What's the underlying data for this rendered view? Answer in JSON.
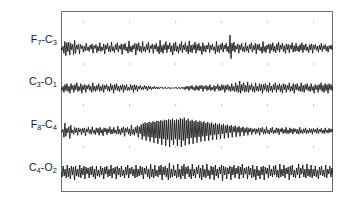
{
  "figure": {
    "background_color": "#ffffff",
    "frame_color": "#6d6d6d",
    "trace_color": "#111111",
    "tick_color": "#c9c9c9",
    "frame": {
      "x": 61,
      "y": 11,
      "width": 272,
      "height": 181
    }
  },
  "labels": {
    "ch1": "F7-C3",
    "ch1_main": "F",
    "ch1_sub1": "7",
    "ch1_mid": "-C",
    "ch1_sub2": "3",
    "ch2": "C3-O1",
    "ch2_main": "C",
    "ch2_sub1": "3",
    "ch2_mid": "-O",
    "ch2_sub2": "1",
    "ch3": "F8-C4",
    "ch3_main": "F",
    "ch3_sub1": "8",
    "ch3_mid": "-C",
    "ch3_sub2": "4",
    "ch4": "C4-O2",
    "ch4_main": "C",
    "ch4_sub1": "4",
    "ch4_mid": "-O",
    "ch4_sub2": "2"
  },
  "chart_data": {
    "type": "line",
    "title": "",
    "xlabel": "",
    "ylabel": "",
    "grid": false,
    "legend_position": "left-labels",
    "axis_ranges": {
      "x": [
        0,
        272
      ],
      "y": [
        0,
        181
      ]
    },
    "tick_marks_x": [
      22,
      68,
      114,
      160,
      206,
      252
    ],
    "tick_rows_y": [
      10,
      52,
      93,
      135
    ],
    "series": [
      {
        "name": "F7-C3",
        "baseline_y": 37,
        "amplitude": 13,
        "description": "moderate-to-high amplitude mixed-frequency activity with a large single transient near x=176",
        "values": [
          0,
          -4,
          3,
          -9,
          11,
          -13,
          9,
          -6,
          10,
          -12,
          8,
          -3,
          6,
          -11,
          13,
          -9,
          5,
          -2,
          7,
          -10,
          6,
          -1,
          4,
          -7,
          3,
          -5,
          8,
          -4,
          2,
          -6,
          5,
          -2,
          7,
          -9,
          4,
          -1,
          6,
          -8,
          3,
          -5,
          9,
          -6,
          2,
          -4,
          7,
          -10,
          5,
          -2,
          8,
          -6,
          3,
          -7,
          10,
          -5,
          2,
          -8,
          6,
          -3,
          9,
          -7,
          4,
          -2,
          7,
          -11,
          6,
          -3,
          8,
          -5,
          2,
          -9,
          12,
          -6,
          3,
          -7,
          5,
          -2,
          8,
          -12,
          7,
          -4,
          9,
          -6,
          3,
          -8,
          11,
          -5,
          2,
          -7,
          6,
          -3,
          10,
          -8,
          4,
          -1,
          7,
          -9,
          5,
          -2,
          8,
          -6,
          3,
          -10,
          13,
          -7,
          4,
          -9,
          6,
          -3,
          11,
          -8,
          5,
          -2,
          9,
          -7,
          4,
          -12,
          8,
          -5,
          10,
          -6,
          3,
          -9,
          7,
          -4,
          11,
          -8,
          5,
          -3,
          9,
          -6,
          4,
          -10,
          12,
          -7,
          5,
          -8,
          6,
          -3,
          10,
          -9,
          6,
          -4,
          8,
          -5,
          3,
          -11,
          9,
          -6,
          4,
          -7,
          5,
          -2,
          9,
          -8,
          5,
          -3,
          7,
          -4,
          2,
          -10,
          11,
          -6,
          4,
          -8,
          6,
          -3,
          9,
          -7,
          5,
          -2,
          8,
          -6,
          3,
          -9,
          22,
          -18,
          8,
          -5,
          10,
          -7,
          4,
          -2,
          7,
          -9,
          5,
          -3,
          8,
          -6,
          2,
          -7,
          9,
          -5,
          3,
          -8,
          6,
          -2,
          9,
          -7,
          4,
          -3,
          8,
          -10,
          6,
          -3,
          7,
          -5,
          2,
          -9,
          11,
          -6,
          3,
          -8,
          5,
          -2,
          7,
          -9,
          6,
          -4,
          9,
          -6,
          3,
          -8,
          7,
          -4,
          10,
          -7,
          5,
          -2,
          8,
          -6,
          4,
          -9,
          7,
          -3,
          6,
          -8,
          5,
          -2,
          9,
          -7,
          4,
          -6,
          8,
          -5,
          3,
          -7,
          6,
          -4,
          9,
          -8,
          5,
          -3,
          7,
          -5,
          2,
          -8,
          6,
          -3,
          7,
          -9,
          5,
          -2,
          6,
          -4,
          3,
          -7,
          5,
          -3,
          8,
          -6,
          4,
          -2,
          6,
          -5,
          3,
          -7,
          4,
          -2,
          5,
          -3,
          2
        ]
      },
      {
        "name": "C3-O1",
        "baseline_y": 77,
        "amplitude": 7,
        "description": "low amplitude activity with a quiescent nearly flat segment mid-recording around x=100-130",
        "values": [
          0,
          -3,
          2,
          -5,
          4,
          -3,
          5,
          -4,
          2,
          -6,
          5,
          -2,
          3,
          -5,
          4,
          -2,
          6,
          -4,
          2,
          -3,
          5,
          -6,
          3,
          -2,
          4,
          -5,
          3,
          -1,
          4,
          -3,
          2,
          -5,
          6,
          -3,
          2,
          -4,
          3,
          -2,
          5,
          -4,
          2,
          -3,
          4,
          -5,
          3,
          -1,
          4,
          -3,
          2,
          -4,
          5,
          -2,
          3,
          -6,
          4,
          -2,
          5,
          -3,
          2,
          -4,
          3,
          -2,
          4,
          -5,
          3,
          -2,
          4,
          -3,
          1,
          -3,
          4,
          -2,
          3,
          -5,
          4,
          -2,
          3,
          -4,
          2,
          -1,
          3,
          -2,
          1,
          -2,
          3,
          -1,
          2,
          -3,
          2,
          -1,
          2,
          -2,
          1,
          -1,
          2,
          -1,
          1,
          -1,
          1,
          -1,
          1,
          0,
          1,
          -1,
          0,
          1,
          -1,
          0,
          0,
          1,
          -1,
          0,
          0,
          0,
          0,
          0,
          1,
          -1,
          0,
          1,
          -1,
          0,
          1,
          -1,
          1,
          -2,
          2,
          -1,
          2,
          -3,
          2,
          -1,
          3,
          -2,
          1,
          -3,
          3,
          -2,
          2,
          -3,
          3,
          -1,
          3,
          -4,
          2,
          -1,
          3,
          -3,
          2,
          -2,
          4,
          -3,
          1,
          -2,
          3,
          -4,
          2,
          -1,
          4,
          -3,
          2,
          -3,
          4,
          -2,
          3,
          -5,
          3,
          -2,
          4,
          -3,
          2,
          -4,
          5,
          -3,
          2,
          -4,
          6,
          -4,
          3,
          -5,
          8,
          -6,
          4,
          -3,
          6,
          -5,
          3,
          -4,
          7,
          -5,
          3,
          -2,
          5,
          -4,
          2,
          -5,
          6,
          -3,
          2,
          -4,
          5,
          -3,
          4,
          -6,
          4,
          -2,
          5,
          -4,
          3,
          -5,
          6,
          -3,
          2,
          -5,
          4,
          -2,
          6,
          -5,
          3,
          -2,
          5,
          -4,
          3,
          -6,
          5,
          -2,
          4,
          -5,
          3,
          -2,
          6,
          -4,
          2,
          -3,
          5,
          -6,
          4,
          -2,
          5,
          -3,
          2,
          -4,
          6,
          -4,
          3,
          -5,
          4,
          -2,
          5,
          -3,
          2,
          -4,
          5,
          -3,
          2,
          -6,
          4,
          -2,
          3,
          -5,
          4,
          -2,
          6,
          -4,
          3,
          -5,
          5,
          -3,
          4,
          -6,
          5,
          -2,
          4,
          -3,
          2
        ]
      },
      {
        "name": "F8-C4",
        "baseline_y": 120,
        "amplitude": 16,
        "description": "high amplitude rhythmic burst between x=95 and x=175, attenuating toward the end",
        "values": [
          0,
          -2,
          3,
          -12,
          15,
          -10,
          5,
          -3,
          8,
          -14,
          11,
          -4,
          2,
          -6,
          7,
          -3,
          5,
          -8,
          6,
          -2,
          4,
          -7,
          5,
          -3,
          6,
          -9,
          4,
          -2,
          7,
          -5,
          3,
          -6,
          8,
          -4,
          2,
          -7,
          6,
          -3,
          5,
          -8,
          7,
          -4,
          3,
          -9,
          6,
          -2,
          5,
          -7,
          4,
          -3,
          8,
          -6,
          3,
          -5,
          7,
          -4,
          2,
          -6,
          9,
          -5,
          3,
          -7,
          6,
          -3,
          8,
          -10,
          5,
          -2,
          7,
          -6,
          4,
          -9,
          11,
          -6,
          3,
          -8,
          7,
          -4,
          10,
          -12,
          8,
          -5,
          12,
          -16,
          14,
          -10,
          16,
          -18,
          15,
          -11,
          17,
          -20,
          16,
          -12,
          18,
          -22,
          17,
          -13,
          19,
          -24,
          18,
          -14,
          20,
          -26,
          19,
          -15,
          21,
          -28,
          20,
          -16,
          22,
          -30,
          21,
          -17,
          23,
          -26,
          20,
          -15,
          22,
          -28,
          21,
          -16,
          24,
          -30,
          22,
          -18,
          25,
          -27,
          20,
          -14,
          23,
          -25,
          19,
          -13,
          21,
          -24,
          18,
          -12,
          20,
          -22,
          17,
          -11,
          19,
          -20,
          16,
          -10,
          18,
          -19,
          15,
          -9,
          17,
          -18,
          14,
          -8,
          16,
          -17,
          13,
          -7,
          15,
          -16,
          12,
          -6,
          14,
          -15,
          11,
          -5,
          13,
          -14,
          10,
          -4,
          12,
          -13,
          9,
          -3,
          11,
          -12,
          8,
          -2,
          10,
          -11,
          7,
          -3,
          9,
          -10,
          6,
          -2,
          8,
          -9,
          5,
          -3,
          7,
          -8,
          5,
          -2,
          6,
          -7,
          4,
          -2,
          5,
          -6,
          4,
          -3,
          6,
          -8,
          5,
          -2,
          7,
          -6,
          3,
          -5,
          8,
          -4,
          2,
          -6,
          5,
          -3,
          7,
          -5,
          2,
          -4,
          6,
          -3,
          5,
          -7,
          4,
          -2,
          6,
          -5,
          3,
          -4,
          7,
          -5,
          2,
          -5,
          6,
          -3,
          4,
          -6,
          5,
          -2,
          4,
          -5,
          3,
          -6,
          7,
          -4,
          2,
          -5,
          4,
          -3,
          6,
          -5,
          2,
          -4,
          5,
          -3,
          4,
          -6,
          5,
          -2,
          3,
          -4,
          6,
          -5,
          3,
          -2,
          5,
          -4,
          2,
          -5,
          6,
          -3,
          2,
          -4,
          5,
          -3,
          4,
          -2,
          3
        ]
      },
      {
        "name": "C4-O2",
        "baseline_y": 161,
        "amplitude": 9,
        "description": "moderate amplitude continuous mixed-frequency activity, relatively uniform across the epoch",
        "values": [
          0,
          -5,
          6,
          -4,
          3,
          -6,
          7,
          -5,
          4,
          -7,
          6,
          -3,
          5,
          -8,
          6,
          -4,
          3,
          -5,
          7,
          -6,
          4,
          -3,
          6,
          -7,
          5,
          -2,
          4,
          -6,
          5,
          -3,
          6,
          -5,
          3,
          -7,
          6,
          -4,
          2,
          -5,
          6,
          -3,
          4,
          -7,
          5,
          -2,
          6,
          -5,
          3,
          -4,
          7,
          -6,
          4,
          -2,
          5,
          -7,
          6,
          -3,
          4,
          -5,
          6,
          -4,
          2,
          -6,
          5,
          -3,
          7,
          -6,
          4,
          -2,
          5,
          -4,
          3,
          -6,
          7,
          -5,
          3,
          -4,
          6,
          -3,
          5,
          -7,
          4,
          -2,
          6,
          -5,
          3,
          -7,
          8,
          -5,
          3,
          -6,
          7,
          -4,
          2,
          -5,
          6,
          -3,
          7,
          -8,
          5,
          -3,
          6,
          -5,
          4,
          -8,
          9,
          -6,
          3,
          -5,
          7,
          -4,
          2,
          -6,
          8,
          -5,
          3,
          -7,
          6,
          -4,
          8,
          -7,
          5,
          -2,
          6,
          -5,
          3,
          -7,
          8,
          -4,
          3,
          -6,
          5,
          -2,
          7,
          -6,
          4,
          -8,
          7,
          -5,
          3,
          -6,
          8,
          -4,
          2,
          -7,
          6,
          -3,
          5,
          -8,
          7,
          -4,
          3,
          -6,
          5,
          -2,
          7,
          -9,
          6,
          -3,
          5,
          -7,
          4,
          -2,
          6,
          -8,
          5,
          -3,
          7,
          -6,
          4,
          -2,
          6,
          -7,
          5,
          -3,
          8,
          -6,
          4,
          -2,
          5,
          -7,
          6,
          -3,
          4,
          -6,
          7,
          -5,
          3,
          -8,
          6,
          -4,
          2,
          -7,
          5,
          -3,
          6,
          -8,
          5,
          -2,
          4,
          -6,
          7,
          -4,
          3,
          -5,
          6,
          -3,
          7,
          -5,
          2,
          -6,
          8,
          -5,
          3,
          -4,
          7,
          -6,
          4,
          -2,
          5,
          -8,
          6,
          -3,
          7,
          -5,
          2,
          -6,
          4,
          -3,
          8,
          -6,
          4,
          -2,
          7,
          -5,
          3,
          -6,
          8,
          -4,
          3,
          -5,
          7,
          -6,
          3,
          -4,
          6,
          -5,
          2,
          -7,
          5,
          -3,
          6,
          -4,
          2,
          -5,
          7,
          -6,
          3,
          -2,
          6,
          -5,
          4,
          -3
        ]
      }
    ]
  }
}
